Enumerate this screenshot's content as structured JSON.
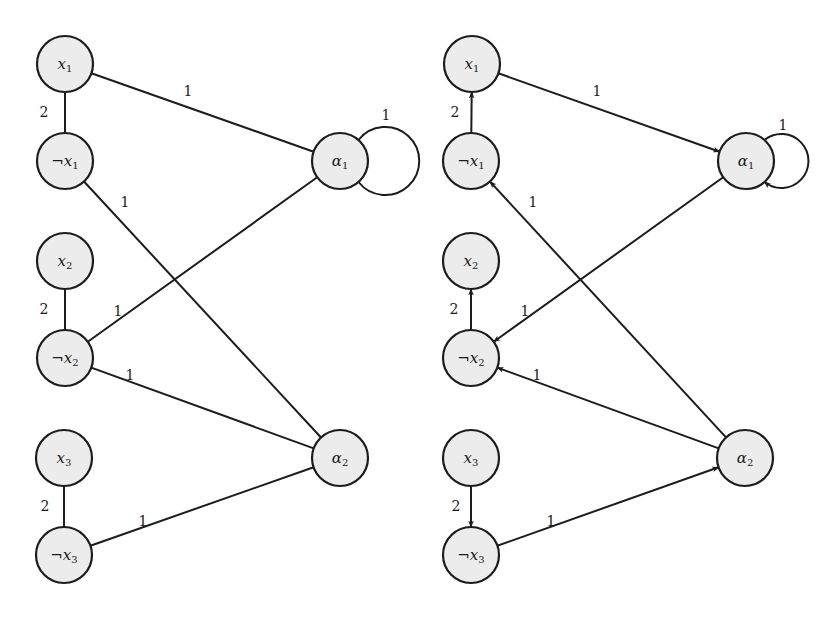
{
  "figure": {
    "graphs": [
      {
        "id": "left",
        "directed": false,
        "nodes": [
          {
            "id": "x1",
            "prefix": "",
            "base": "x",
            "sub": "1",
            "cx": 65,
            "cy": 64
          },
          {
            "id": "nx1",
            "prefix": "¬",
            "base": "x",
            "sub": "1",
            "cx": 65,
            "cy": 161
          },
          {
            "id": "x2",
            "prefix": "",
            "base": "x",
            "sub": "2",
            "cx": 65,
            "cy": 261
          },
          {
            "id": "nx2",
            "prefix": "¬",
            "base": "x",
            "sub": "2",
            "cx": 65,
            "cy": 358
          },
          {
            "id": "x3",
            "prefix": "",
            "base": "x",
            "sub": "3",
            "cx": 64,
            "cy": 458
          },
          {
            "id": "nx3",
            "prefix": "¬",
            "base": "x",
            "sub": "3",
            "cx": 64,
            "cy": 555
          },
          {
            "id": "a1",
            "prefix": "",
            "base": "α",
            "sub": "1",
            "cx": 340,
            "cy": 161
          },
          {
            "id": "a2",
            "prefix": "",
            "base": "α",
            "sub": "2",
            "cx": 340,
            "cy": 458
          }
        ],
        "edges": [
          {
            "from": "x1",
            "to": "nx1",
            "label": "2",
            "lx": 44,
            "ly": 117
          },
          {
            "from": "x2",
            "to": "nx2",
            "label": "2",
            "lx": 44,
            "ly": 314
          },
          {
            "from": "x3",
            "to": "nx3",
            "label": "2",
            "lx": 45,
            "ly": 511
          },
          {
            "from": "x1",
            "to": "a1",
            "label": "1",
            "lx": 188,
            "ly": 96
          },
          {
            "from": "nx1",
            "to": "a2",
            "label": "1",
            "lx": 125,
            "ly": 207
          },
          {
            "from": "nx2",
            "to": "a1",
            "label": "1",
            "lx": 118,
            "ly": 316
          },
          {
            "from": "nx2",
            "to": "a2",
            "label": "1",
            "lx": 130,
            "ly": 380
          },
          {
            "from": "nx3",
            "to": "a2",
            "label": "1",
            "lx": 143,
            "ly": 526
          },
          {
            "from": "a1",
            "to": "a1",
            "label": "1",
            "lx": 386,
            "ly": 120,
            "loop": true
          }
        ]
      },
      {
        "id": "right",
        "directed": true,
        "nodes": [
          {
            "id": "x1",
            "prefix": "",
            "base": "x",
            "sub": "1",
            "cx": 472,
            "cy": 64
          },
          {
            "id": "nx1",
            "prefix": "¬",
            "base": "x",
            "sub": "1",
            "cx": 471,
            "cy": 161
          },
          {
            "id": "x2",
            "prefix": "",
            "base": "x",
            "sub": "2",
            "cx": 471,
            "cy": 261
          },
          {
            "id": "nx2",
            "prefix": "¬",
            "base": "x",
            "sub": "2",
            "cx": 471,
            "cy": 358
          },
          {
            "id": "x3",
            "prefix": "",
            "base": "x",
            "sub": "3",
            "cx": 471,
            "cy": 458
          },
          {
            "id": "nx3",
            "prefix": "¬",
            "base": "x",
            "sub": "3",
            "cx": 471,
            "cy": 555
          },
          {
            "id": "a1",
            "prefix": "",
            "base": "α",
            "sub": "1",
            "cx": 746,
            "cy": 161
          },
          {
            "id": "a2",
            "prefix": "",
            "base": "α",
            "sub": "2",
            "cx": 745,
            "cy": 458
          }
        ],
        "edges": [
          {
            "from": "nx1",
            "to": "x1",
            "label": "2",
            "lx": 455,
            "ly": 117
          },
          {
            "from": "nx2",
            "to": "x2",
            "label": "2",
            "lx": 454,
            "ly": 314
          },
          {
            "from": "x3",
            "to": "nx3",
            "label": "2",
            "lx": 456,
            "ly": 511
          },
          {
            "from": "x1",
            "to": "a1",
            "label": "1",
            "lx": 597,
            "ly": 96
          },
          {
            "from": "a2",
            "to": "nx1",
            "label": "1",
            "lx": 533,
            "ly": 207
          },
          {
            "from": "a1",
            "to": "nx2",
            "label": "1",
            "lx": 525,
            "ly": 316
          },
          {
            "from": "a2",
            "to": "nx2",
            "label": "1",
            "lx": 537,
            "ly": 380
          },
          {
            "from": "nx3",
            "to": "a2",
            "label": "1",
            "lx": 551,
            "ly": 526
          },
          {
            "from": "a1",
            "to": "a1",
            "label": "1",
            "lx": 783,
            "ly": 130,
            "loop": true
          }
        ]
      }
    ]
  }
}
